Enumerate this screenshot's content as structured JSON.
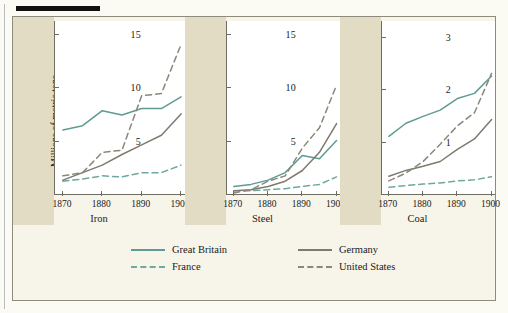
{
  "figure": {
    "y_axis_caption": "Millions of metric tons",
    "legend": [
      {
        "label": "Great Britain",
        "color": "#5f9b92",
        "dash": "solid"
      },
      {
        "label": "France",
        "color": "#6fa89f",
        "dash": "dashed"
      },
      {
        "label": "Germany",
        "color": "#7d7a6e",
        "dash": "solid"
      },
      {
        "label": "United States",
        "color": "#8b877a",
        "dash": "dashed"
      }
    ]
  },
  "chart_data": [
    {
      "type": "line",
      "title": "Iron",
      "xlabel": "",
      "ylabel": "Millions of metric tons",
      "x": [
        1870,
        1875,
        1880,
        1885,
        1890,
        1895,
        1900
      ],
      "xlim": [
        1868,
        1901
      ],
      "ylim": [
        0,
        16.2
      ],
      "xticks": [
        1870,
        1880,
        1890,
        1900
      ],
      "yticks": [
        5,
        10,
        15
      ],
      "grid": false,
      "legend_position": "below-figure",
      "series": [
        {
          "name": "Great Britain",
          "values": [
            6.0,
            6.4,
            7.8,
            7.4,
            8.0,
            8.0,
            9.1
          ]
        },
        {
          "name": "France",
          "values": [
            1.2,
            1.4,
            1.7,
            1.6,
            2.0,
            2.0,
            2.7
          ]
        },
        {
          "name": "Germany",
          "values": [
            1.3,
            2.0,
            2.7,
            3.7,
            4.6,
            5.5,
            7.5
          ]
        },
        {
          "name": "United States",
          "values": [
            1.7,
            2.0,
            3.9,
            4.1,
            9.2,
            9.4,
            14.0
          ]
        }
      ]
    },
    {
      "type": "line",
      "title": "Steel",
      "xlabel": "",
      "ylabel": "",
      "x": [
        1870,
        1875,
        1880,
        1885,
        1890,
        1895,
        1900
      ],
      "xlim": [
        1868,
        1901
      ],
      "ylim": [
        0,
        16.2
      ],
      "xticks": [
        1870,
        1880,
        1890,
        1900
      ],
      "yticks": [
        5,
        10,
        15
      ],
      "grid": false,
      "legend_position": "below-figure",
      "series": [
        {
          "name": "Great Britain",
          "values": [
            0.7,
            0.9,
            1.3,
            2.0,
            3.6,
            3.3,
            5.0
          ]
        },
        {
          "name": "France",
          "values": [
            0.3,
            0.3,
            0.4,
            0.5,
            0.7,
            0.9,
            1.6
          ]
        },
        {
          "name": "Germany",
          "values": [
            0.3,
            0.4,
            0.7,
            1.2,
            2.2,
            3.9,
            6.6
          ]
        },
        {
          "name": "United States",
          "values": [
            0.1,
            0.4,
            1.2,
            1.7,
            4.3,
            6.2,
            10.2
          ]
        }
      ]
    },
    {
      "type": "line",
      "title": "Coal",
      "xlabel": "",
      "ylabel": "",
      "x": [
        1870,
        1875,
        1880,
        1885,
        1890,
        1895,
        1900
      ],
      "xlim": [
        1868,
        1901
      ],
      "ylim": [
        0,
        3.3
      ],
      "xticks": [
        1870,
        1880,
        1890,
        1900
      ],
      "yticks": [
        1,
        2,
        3
      ],
      "grid": false,
      "legend_position": "below-figure",
      "series": [
        {
          "name": "Great Britain",
          "values": [
            1.1,
            1.35,
            1.48,
            1.6,
            1.82,
            1.92,
            2.25
          ]
        },
        {
          "name": "France",
          "values": [
            0.13,
            0.16,
            0.19,
            0.21,
            0.25,
            0.27,
            0.33
          ]
        },
        {
          "name": "Germany",
          "values": [
            0.34,
            0.45,
            0.53,
            0.62,
            0.85,
            1.05,
            1.42
          ]
        },
        {
          "name": "United States",
          "values": [
            0.25,
            0.4,
            0.62,
            0.95,
            1.3,
            1.55,
            2.3
          ]
        }
      ]
    }
  ]
}
